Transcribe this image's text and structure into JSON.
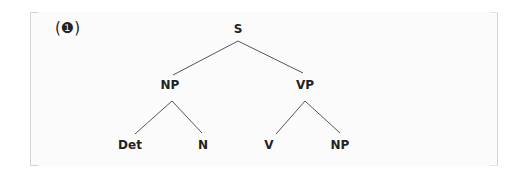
{
  "example": {
    "number_label": "(❶)"
  },
  "tree": {
    "line_color": "#555555",
    "nodes": {
      "root": "S",
      "np": "NP",
      "vp": "VP",
      "det": "Det",
      "n": "N",
      "v": "V",
      "np2": "NP"
    },
    "structure": "[S [NP Det N] [VP V NP]]"
  }
}
